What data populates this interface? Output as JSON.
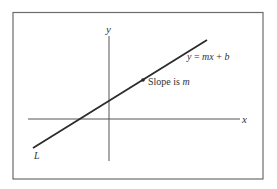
{
  "figure": {
    "equation_label": "y = mx + b",
    "equation_parts": {
      "lhs": "y",
      "eq": " = ",
      "m": "m",
      "x": "x",
      "plus": " + ",
      "b": "b"
    },
    "slope_label": {
      "text": "Slope is ",
      "var": "m"
    },
    "line_label": "L",
    "x_axis_label": "x",
    "y_axis_label": "y"
  },
  "colors": {
    "line": "#2b2b2b",
    "axes": "#555555",
    "frame": "#6b6b6b",
    "text": "#333333"
  }
}
